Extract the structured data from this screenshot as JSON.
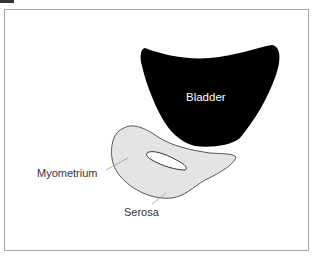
{
  "figure": {
    "panel_marker": "",
    "labels": {
      "bladder": "Bladder",
      "myometrium": "Myometrium",
      "serosa": "Serosa"
    },
    "colors": {
      "bladder_fill": "#000000",
      "uterus_fill": "#e4e4e4",
      "uterus_outline": "#555555",
      "cavity_fill": "#ffffff",
      "frame_border": "#a6a6a6",
      "leader_line": "#9a9a9a"
    }
  }
}
